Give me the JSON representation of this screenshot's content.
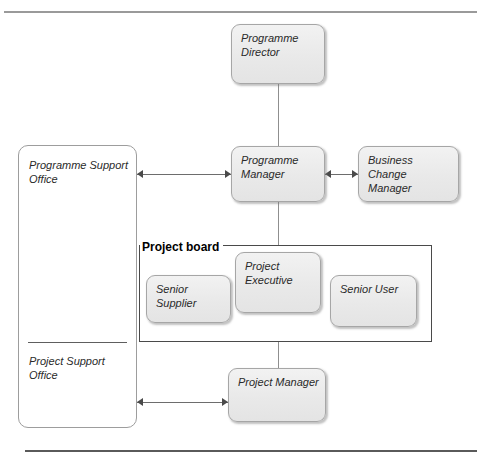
{
  "diagram": {
    "type": "organisation-chart",
    "title_visible": false,
    "nodes": [
      {
        "id": "programme-director",
        "label": "Programme Director",
        "style": "grey-rounded",
        "x": 231,
        "y": 24,
        "w": 94,
        "h": 60
      },
      {
        "id": "programme-manager",
        "label": "Programme Manager",
        "style": "grey-rounded",
        "x": 231,
        "y": 146,
        "w": 94,
        "h": 56
      },
      {
        "id": "business-change-manager",
        "label": "Business Change\nManager",
        "style": "grey-rounded",
        "x": 358,
        "y": 146,
        "w": 101,
        "h": 56
      },
      {
        "id": "senior-supplier",
        "label": "Senior Supplier",
        "style": "grey-rounded",
        "x": 146,
        "y": 275,
        "w": 85,
        "h": 48
      },
      {
        "id": "project-executive",
        "label": "Project Executive",
        "style": "grey-rounded",
        "x": 235,
        "y": 252,
        "w": 86,
        "h": 61
      },
      {
        "id": "senior-user",
        "label": "Senior User",
        "style": "grey-rounded",
        "x": 330,
        "y": 275,
        "w": 87,
        "h": 52
      },
      {
        "id": "project-manager",
        "label": "Project Manager",
        "style": "grey-rounded",
        "x": 228,
        "y": 368,
        "w": 98,
        "h": 54
      }
    ],
    "office_column": {
      "id": "support-office-column",
      "x": 18,
      "y": 145,
      "w": 119,
      "h": 283,
      "top_label": "Programme Support\nOffice",
      "bottom_label": "Project Support\nOffice",
      "divider_y": 342
    },
    "group": {
      "id": "project-board",
      "label": "Project board",
      "x": 139,
      "y": 245,
      "w": 293,
      "h": 97
    },
    "connectors": [
      {
        "id": "director-to-programme-manager",
        "kind": "line",
        "from": "programme-director",
        "to": "programme-manager"
      },
      {
        "id": "programme-manager-to-board",
        "kind": "line",
        "from": "programme-manager",
        "to": "project-board"
      },
      {
        "id": "board-to-project-manager",
        "kind": "line",
        "from": "project-board",
        "to": "project-manager"
      },
      {
        "id": "programme-support-office-to-programme-manager",
        "kind": "double-arrow",
        "from": "support-office-column",
        "to": "programme-manager"
      },
      {
        "id": "programme-manager-to-business-change-manager",
        "kind": "double-arrow",
        "from": "programme-manager",
        "to": "business-change-manager"
      },
      {
        "id": "project-support-office-to-project-manager",
        "kind": "double-arrow",
        "from": "support-office-column",
        "to": "project-manager"
      }
    ]
  },
  "colors": {
    "node_fill": "#ececec",
    "node_border": "#a6a6a6",
    "frame_border": "#4a4a4a",
    "connector": "#6d6d6d",
    "rule_top": "#9a9a9a",
    "rule_bottom": "#5a5a5a",
    "page_background": "#ffffff",
    "text": "#2a2a2a"
  }
}
